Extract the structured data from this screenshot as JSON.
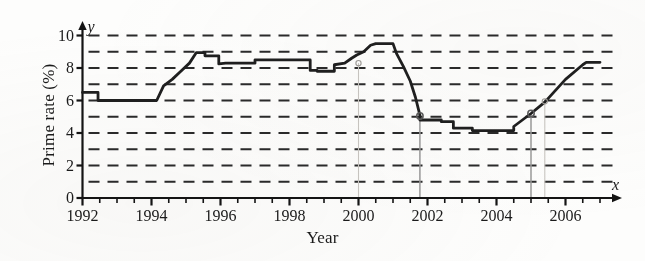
{
  "chart_data": {
    "type": "line",
    "title": "",
    "xlabel": "Year",
    "ylabel": "Prime rate (%)",
    "xlim": [
      1992,
      2007
    ],
    "ylim": [
      0,
      10
    ],
    "grid": true,
    "grid_style": "dashed-horizontal",
    "legend": "none",
    "x_axis_variable": "x",
    "y_axis_variable": "y",
    "xticks": [
      1992,
      1994,
      1996,
      1998,
      2000,
      2002,
      2004,
      2006
    ],
    "xtick_labels": [
      "1992",
      "1994",
      "1996",
      "1998",
      "2000",
      "2002",
      "2004",
      "2006"
    ],
    "x_minor_tick_step": 0.5,
    "yticks": [
      0,
      2,
      4,
      6,
      8,
      10
    ],
    "ytick_labels": [
      "0",
      "2",
      "4",
      "6",
      "8",
      "10"
    ],
    "y_gridlines": [
      1,
      2,
      3,
      4,
      5,
      6,
      7,
      8,
      9,
      10
    ],
    "series": [
      {
        "name": "Prime rate",
        "x": [
          1992.0,
          1992.45,
          1992.45,
          1994.15,
          1994.35,
          1994.6,
          1994.85,
          1995.1,
          1995.3,
          1995.55,
          1995.55,
          1995.95,
          1995.95,
          1996.15,
          1997.0,
          1997.0,
          1998.6,
          1998.6,
          1998.8,
          1998.8,
          1999.3,
          1999.3,
          1999.6,
          1999.8,
          1999.95,
          2000.15,
          2000.35,
          2000.5,
          2001.0,
          2001.1,
          2001.3,
          2001.5,
          2001.65,
          2001.78,
          2001.78,
          2002.4,
          2002.4,
          2002.75,
          2002.75,
          2003.3,
          2003.3,
          2004.5,
          2004.5,
          2005.0,
          2005.4,
          2006.0,
          2006.5,
          2006.6,
          2007.0
        ],
        "y": [
          6.5,
          6.5,
          6.0,
          6.0,
          6.9,
          7.3,
          7.8,
          8.3,
          8.95,
          8.95,
          8.75,
          8.75,
          8.25,
          8.3,
          8.3,
          8.5,
          8.5,
          7.85,
          7.85,
          7.8,
          7.8,
          8.2,
          8.3,
          8.6,
          8.8,
          9.0,
          9.4,
          9.5,
          9.5,
          8.9,
          8.1,
          7.2,
          6.2,
          5.1,
          4.8,
          4.8,
          4.7,
          4.7,
          4.3,
          4.3,
          4.15,
          4.15,
          4.4,
          5.2,
          5.9,
          7.3,
          8.2,
          8.35,
          8.35
        ]
      }
    ],
    "reference_lines": [
      {
        "name": "vertical-line-2001-78",
        "x": 2001.78,
        "y_top": 5.05,
        "y_bottom": 0,
        "marker": true,
        "marker_y": 5.05
      },
      {
        "name": "vertical-line-2005",
        "x": 2005.0,
        "y_top": 5.2,
        "y_bottom": 0,
        "marker": true,
        "marker_y": 5.2
      },
      {
        "name": "faint-vertical-2000",
        "x": 2000.0,
        "y_top": 8.3,
        "y_bottom": 0,
        "marker": true,
        "marker_y": 8.3
      },
      {
        "name": "faint-vertical-2005-4",
        "x": 2005.4,
        "y_top": 5.95,
        "y_bottom": 0,
        "marker": true,
        "marker_y": 5.95
      }
    ],
    "colors": {
      "curve": "#1f1f1f",
      "grid": "#2a2a2a",
      "axis": "#141414",
      "reference_line": "#9a9a9a",
      "background": "#fdfdfc"
    }
  }
}
